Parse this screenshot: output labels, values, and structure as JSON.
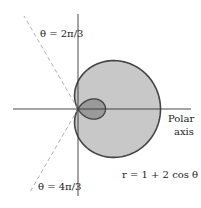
{
  "figure": {
    "equation": "r = 1 + 2 cos θ",
    "ray_upper": "θ = 2π/3",
    "ray_lower": "θ = 4π/3",
    "axis_label_line1": "Polar",
    "axis_label_line2": "axis",
    "colors": {
      "fill": "#c8c8c8",
      "inner_fill": "#9a9a9a",
      "stroke": "#444444",
      "axis": "#333333",
      "dashed": "#999999"
    }
  }
}
